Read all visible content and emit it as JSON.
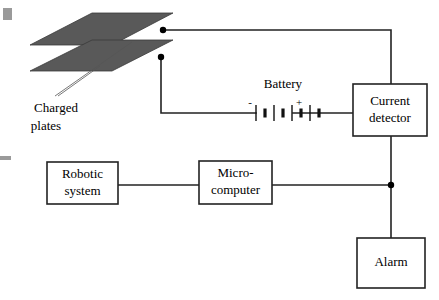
{
  "diagram": {
    "background_color": "#ffffff",
    "line_color": "#222222",
    "plate_fill_color": "#595959",
    "text_color": "#000000"
  },
  "labels": {
    "charged_plates_line1": "Charged",
    "charged_plates_line2": "plates",
    "battery": "Battery",
    "battery_negative": "-",
    "battery_positive": "+"
  },
  "boxes": [
    {
      "id": "current-detector",
      "line1": "Current",
      "line2": "detector",
      "x": 353,
      "y": 84,
      "width": 74,
      "height": 52
    },
    {
      "id": "robotic-system",
      "line1": "Robotic",
      "line2": "system",
      "x": 47,
      "y": 162,
      "width": 71,
      "height": 42
    },
    {
      "id": "micro-computer",
      "line1": "Micro-",
      "line2": "computer",
      "x": 199,
      "y": 161,
      "width": 73,
      "height": 43
    },
    {
      "id": "alarm",
      "line1": "Alarm",
      "line2": "",
      "x": 357,
      "y": 238,
      "width": 68,
      "height": 50
    }
  ],
  "battery": {
    "cells": 4,
    "long_plate_height": 16,
    "short_plate_height": 9,
    "center_y": 113,
    "start_x": 256,
    "spacing": 9
  },
  "junctions": [
    {
      "id": "top-plate-terminal",
      "x": 163,
      "y": 30
    },
    {
      "id": "bottom-plate-terminal",
      "x": 161,
      "y": 57
    },
    {
      "id": "alarm-branch",
      "x": 391,
      "y": 185
    }
  ],
  "plates": {
    "top": {
      "points": "30,45 92,13 173,13 112,45"
    },
    "bottom": {
      "points": "30,71 92,40 173,40 112,71"
    }
  }
}
